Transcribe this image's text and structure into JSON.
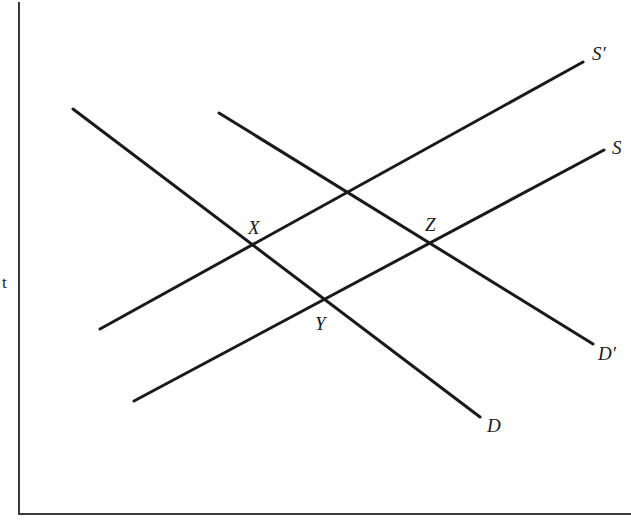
{
  "diagram": {
    "type": "supply-demand",
    "axes": {
      "y_label": "t",
      "x_label": ""
    },
    "lines": [
      {
        "id": "D",
        "label": "D",
        "kind": "demand",
        "x1": 73,
        "y1": 109,
        "x2": 480,
        "y2": 417
      },
      {
        "id": "D_prime",
        "label": "D′",
        "kind": "demand",
        "x1": 219,
        "y1": 113,
        "x2": 593,
        "y2": 344
      },
      {
        "id": "S",
        "label": "S",
        "kind": "supply",
        "x1": 134,
        "y1": 401,
        "x2": 604,
        "y2": 150
      },
      {
        "id": "S_prime",
        "label": "S′",
        "kind": "supply",
        "x1": 100,
        "y1": 329,
        "x2": 583,
        "y2": 62
      }
    ],
    "points": [
      {
        "id": "X",
        "label": "X",
        "note": "intersection of D and S′"
      },
      {
        "id": "Y",
        "label": "Y",
        "note": "intersection of D and S"
      },
      {
        "id": "Z",
        "label": "Z",
        "note": "intersection of D′ and S"
      }
    ],
    "labels": {
      "S_prime": "S′",
      "S": "S",
      "D_prime": "D′",
      "D": "D",
      "X": "X",
      "Y": "Y",
      "Z": "Z"
    },
    "colors": {
      "line": "#1a1a1a",
      "axis": "#3a3a3a",
      "background": "#ffffff"
    }
  }
}
